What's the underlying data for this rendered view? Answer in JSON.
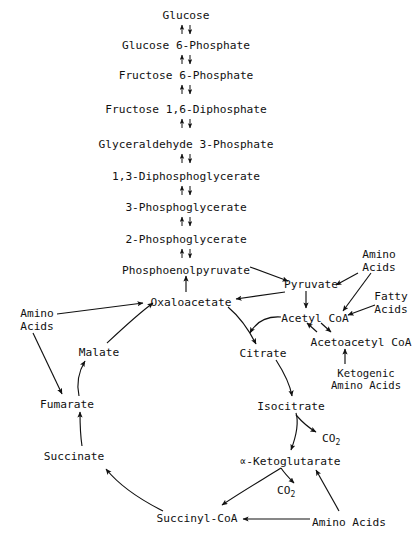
{
  "diagram": {
    "background_color": "#ffffff",
    "ink_color": "#111111",
    "width": 419,
    "height": 540
  },
  "glycolysis": {
    "name": "Glycolysis chain",
    "reversible_arrow_glyph": "up-down-arrow-pair",
    "steps": [
      {
        "id": "glucose",
        "label": "Glucose",
        "x": 186,
        "y": 19
      },
      {
        "id": "glucose-6-phosphate",
        "label": "Glucose 6-Phosphate",
        "x": 186,
        "y": 45
      },
      {
        "id": "fructose-6-phosphate",
        "label": "Fructose 6-Phosphate",
        "x": 186,
        "y": 75
      },
      {
        "id": "fructose-1-6-diphosphate",
        "label": "Fructose 1,6-Diphosphate",
        "x": 186,
        "y": 105
      },
      {
        "id": "glyceraldehyde-3-phosphate",
        "label": "Glyceraldehyde 3-Phosphate",
        "x": 186,
        "y": 140
      },
      {
        "id": "1-3-diphosphoglycerate",
        "label": "1,3-Diphosphoglycerate",
        "x": 186,
        "y": 175
      },
      {
        "id": "3-phosphoglycerate",
        "label": "3-Phosphoglycerate",
        "x": 186,
        "y": 207
      },
      {
        "id": "2-phosphoglycerate",
        "label": "2-Phosphoglycerate",
        "x": 186,
        "y": 238
      },
      {
        "id": "phosphoenolpyruvate",
        "label": "Phosphoenolpyruvate",
        "x": 186,
        "y": 270
      }
    ]
  },
  "krebs_cycle": {
    "name": "Citric acid cycle",
    "nodes": [
      {
        "id": "oxaloacetate",
        "label": "Oxaloacetate",
        "x": 191,
        "y": 302
      },
      {
        "id": "citrate",
        "label": "Citrate",
        "x": 263,
        "y": 353
      },
      {
        "id": "isocitrate",
        "label": "Isocitrate",
        "x": 291,
        "y": 406
      },
      {
        "id": "alpha-ketoglutarate",
        "label": "∝-Ketoglutarate",
        "x": 290,
        "y": 461
      },
      {
        "id": "succinyl-coa",
        "label": "Succinyl-CoA",
        "x": 197,
        "y": 518
      },
      {
        "id": "succinate",
        "label": "Succinate",
        "x": 74,
        "y": 456
      },
      {
        "id": "fumarate",
        "label": "Fumarate",
        "x": 67,
        "y": 404
      },
      {
        "id": "malate",
        "label": "Malate",
        "x": 99,
        "y": 352
      }
    ]
  },
  "cofactor_nodes": [
    {
      "id": "pyruvate",
      "label": "Pyruvate",
      "x": 311,
      "y": 284
    },
    {
      "id": "acetyl-coa",
      "label": "Acetyl CoA",
      "x": 315,
      "y": 318
    },
    {
      "id": "acetoacetyl-coa",
      "label": "Acetoacetyl CoA",
      "x": 361,
      "y": 342
    }
  ],
  "input_labels": [
    {
      "id": "amino-acids-left",
      "line1": "Amino",
      "line2": "Acids",
      "x": 37,
      "y1": 313,
      "y2": 325,
      "feeds": [
        "oxaloacetate",
        "fumarate"
      ]
    },
    {
      "id": "amino-acids-top-right",
      "line1": "Amino",
      "line2": "Acids",
      "x": 379,
      "y1": 254,
      "y2": 266,
      "feeds": [
        "pyruvate",
        "acetyl-coa"
      ]
    },
    {
      "id": "fatty-acids",
      "line1": "Fatty",
      "line2": "Acids",
      "x": 391,
      "y1": 296,
      "y2": 308,
      "feeds": [
        "acetyl-coa"
      ]
    },
    {
      "id": "ketogenic-amino-acids",
      "line1": "Ketogenic",
      "line2": "Amino Acids",
      "x": 366,
      "y1": 373,
      "y2": 385,
      "feeds": [
        "acetoacetyl-coa"
      ]
    },
    {
      "id": "amino-acids-bottom",
      "line1": "Amino Acids",
      "line2": "",
      "x": 349,
      "y1": 522,
      "y2": 522,
      "feeds": [
        "succinyl-coa",
        "alpha-ketoglutarate"
      ]
    }
  ],
  "byproducts": [
    {
      "id": "co2-isocitrate",
      "label": "CO",
      "subscript": "2",
      "x": 322,
      "y": 438,
      "from": "isocitrate"
    },
    {
      "id": "co2-ketoglutarate",
      "label": "CO",
      "subscript": "2",
      "x": 277,
      "y": 490,
      "from": "alpha-ketoglutarate"
    }
  ],
  "connections": [
    {
      "from": "phosphoenolpyruvate",
      "to": "oxaloacetate",
      "type": "straight-up-arrow"
    },
    {
      "from": "phosphoenolpyruvate",
      "to": "pyruvate",
      "type": "straight-arrow"
    },
    {
      "from": "pyruvate",
      "to": "oxaloacetate",
      "type": "straight-arrow"
    },
    {
      "from": "pyruvate",
      "to": "acetyl-coa",
      "type": "straight-down-arrow"
    },
    {
      "from": "acetyl-coa",
      "to": "citrate",
      "type": "curved-arrow"
    },
    {
      "from": "oxaloacetate",
      "to": "citrate",
      "type": "curved-arrow"
    },
    {
      "from": "citrate",
      "to": "isocitrate",
      "type": "curved-arrow"
    },
    {
      "from": "isocitrate",
      "to": "alpha-ketoglutarate",
      "type": "curved-arrow"
    },
    {
      "from": "alpha-ketoglutarate",
      "to": "succinyl-coa",
      "type": "curved-arrow"
    },
    {
      "from": "succinyl-coa",
      "to": "succinate",
      "type": "curved-arrow"
    },
    {
      "from": "succinate",
      "to": "fumarate",
      "type": "curved-arrow"
    },
    {
      "from": "fumarate",
      "to": "malate",
      "type": "curved-arrow"
    },
    {
      "from": "malate",
      "to": "oxaloacetate",
      "type": "curved-arrow"
    },
    {
      "from": "acetyl-coa",
      "to": "acetoacetyl-coa",
      "type": "reversible-diagonal-pair"
    }
  ]
}
